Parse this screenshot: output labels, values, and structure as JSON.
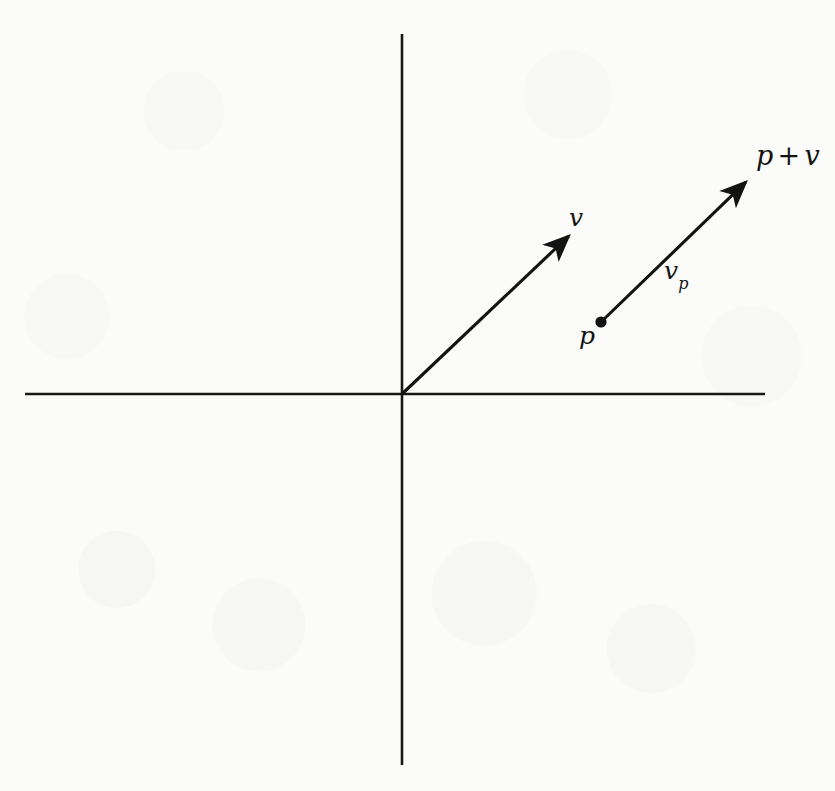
{
  "figure": {
    "kind": "vector-diagram",
    "background_color": "#fbfbfa",
    "ink_color": "#131313",
    "canvas": {
      "width": 835,
      "height": 791
    }
  },
  "axes": {
    "name": "cartesian-axes",
    "origin": {
      "x": 402,
      "y": 394
    },
    "horizontal": {
      "x1": 25,
      "y1": 394,
      "x2": 765,
      "y2": 394
    },
    "vertical": {
      "x1": 402,
      "y1": 34,
      "x2": 402,
      "y2": 765
    },
    "stroke_width": 2.6,
    "tick_labels": [],
    "grid": false
  },
  "labels": {
    "v": "v",
    "p": "p",
    "v_sub": "v",
    "v_subscript": "p",
    "sum_left": "p",
    "sum_op": "+",
    "sum_right": "v"
  },
  "vectors": [
    {
      "name": "vector-v",
      "label": "v",
      "from": {
        "x": 402,
        "y": 394
      },
      "to": {
        "x": 573,
        "y": 232
      },
      "stroke_width": 3.1,
      "arrowhead": true
    },
    {
      "name": "vector-v-p",
      "label": "v_p",
      "from": {
        "x": 601,
        "y": 322
      },
      "to": {
        "x": 750,
        "y": 178
      },
      "stroke_width": 3.1,
      "arrowhead": true
    }
  ],
  "points": [
    {
      "name": "point-p",
      "label": "p",
      "x": 601,
      "y": 322,
      "radius": 5.6
    }
  ],
  "annotations": [
    {
      "name": "label-v",
      "text": "v",
      "x": 578,
      "y": 218
    },
    {
      "name": "label-p",
      "text": "p",
      "x": 587,
      "y": 337
    },
    {
      "name": "label-v-p",
      "text": "vp",
      "x": 678,
      "y": 272
    },
    {
      "name": "label-p-plus-v",
      "text": "p + v",
      "x": 787,
      "y": 158
    }
  ],
  "chart_data": {
    "type": "scatter",
    "title": "",
    "xlabel": "",
    "ylabel": "",
    "grid": false,
    "legend": null,
    "xlim": [
      -2.2,
      2.2
    ],
    "ylim": [
      -2.2,
      2.2
    ],
    "arrows": [
      {
        "name": "v",
        "tail": [
          0.0,
          0.0
        ],
        "head": [
          1.02,
          0.97
        ],
        "label": "v"
      },
      {
        "name": "v_p",
        "tail": [
          1.19,
          0.43
        ],
        "head": [
          2.08,
          1.3
        ],
        "label": "vp"
      }
    ],
    "points": [
      {
        "name": "p",
        "x": 1.19,
        "y": 0.43,
        "label": "p"
      },
      {
        "name": "p_plus_v",
        "x": 2.08,
        "y": 1.3,
        "label": "p + v"
      }
    ]
  }
}
